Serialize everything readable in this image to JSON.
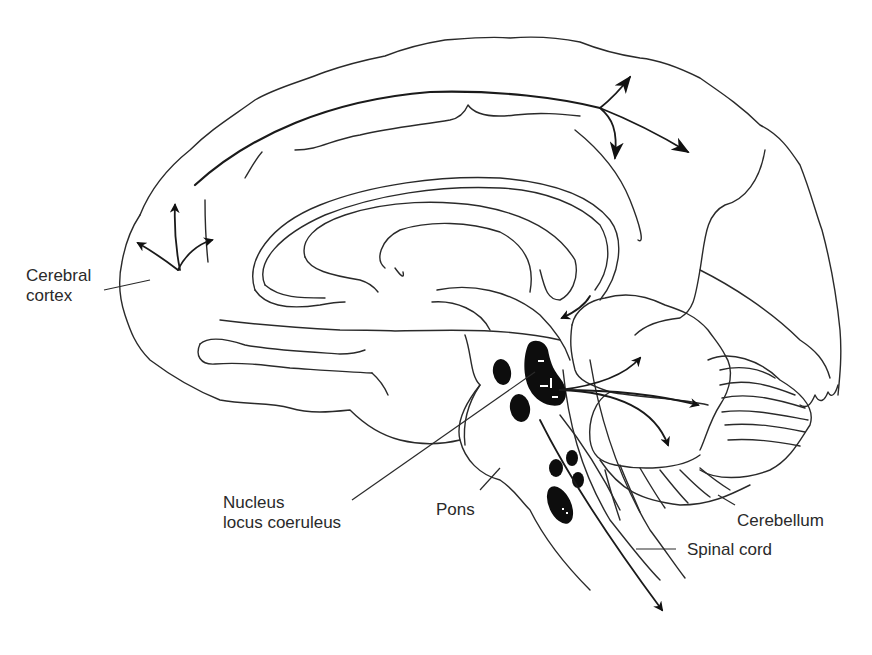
{
  "figure": {
    "type": "anatomical-diagram",
    "stroke_color": "#2a2a2a",
    "nucleus_fill": "#0d0d0d",
    "background": "#ffffff"
  },
  "labels": {
    "cerebral_cortex": {
      "line1": "Cerebral",
      "line2": "cortex"
    },
    "nucleus_locus_coeruleus": {
      "line1": "Nucleus",
      "line2": "locus coeruleus"
    },
    "pons": "Pons",
    "cerebellum": "Cerebellum",
    "spinal_cord": "Spinal cord"
  },
  "projections": [
    {
      "target": "cerebral cortex (frontal)",
      "arrows": 3
    },
    {
      "target": "cerebral cortex (parietal)",
      "arrows": 3
    },
    {
      "target": "cerebellum",
      "arrows": 3
    },
    {
      "target": "thalamus/hypothalamus",
      "arrows": 1
    },
    {
      "target": "spinal cord",
      "arrows": 1
    }
  ]
}
